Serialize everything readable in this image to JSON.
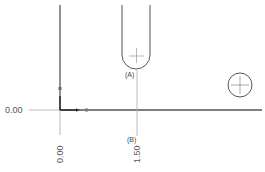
{
  "drawing": {
    "type": "cad-ordinate-dimensioning",
    "origin_label_horizontal": "0.00",
    "origin_label_vertical": "0.00",
    "ordinate_dimensions": [
      {
        "axis": "x",
        "value": "1.50",
        "tag": "(B)"
      }
    ],
    "features": [
      {
        "kind": "slot",
        "tag": "(A)"
      },
      {
        "kind": "hole",
        "tag": ""
      }
    ],
    "colors": {
      "geometry": "#444444",
      "dimension": "#999999",
      "text": "#555555"
    }
  }
}
